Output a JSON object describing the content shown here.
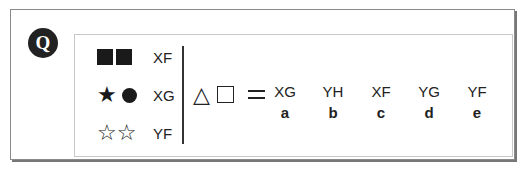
{
  "question": {
    "badge": "Q",
    "key": [
      {
        "symbols": [
          "filled-square",
          "filled-square"
        ],
        "code": "XF"
      },
      {
        "symbols": [
          "filled-star",
          "filled-circle"
        ],
        "code": "XG"
      },
      {
        "symbols": [
          "outline-star",
          "outline-star"
        ],
        "code": "YF"
      }
    ],
    "query": {
      "symbols": [
        "outline-triangle",
        "outline-square"
      ],
      "triangle_glyph": "△",
      "operator": "="
    },
    "options": [
      {
        "value": "XG",
        "letter": "a"
      },
      {
        "value": "YH",
        "letter": "b"
      },
      {
        "value": "XF",
        "letter": "c"
      },
      {
        "value": "YG",
        "letter": "d"
      },
      {
        "value": "YF",
        "letter": "e"
      }
    ],
    "glyphs": {
      "filled_star": "★",
      "outline_star": "☆"
    }
  }
}
